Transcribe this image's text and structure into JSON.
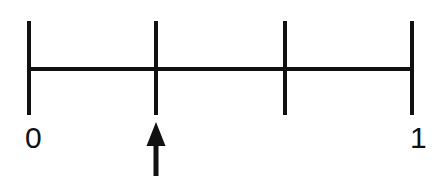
{
  "figure": {
    "kind": "number-line-diagram",
    "background_color": "#ffffff",
    "ink_color": "#111111",
    "width": 437,
    "height": 176
  },
  "chart_data": {
    "type": "line",
    "title": "",
    "subtitle": "",
    "xlabel": "",
    "ylabel": "",
    "orientation": "horizontal",
    "grid": false,
    "legend": null,
    "xlim": [
      0,
      1
    ],
    "axis": {
      "start_value": 0,
      "end_value": 1,
      "start_label": "0",
      "end_label": "1",
      "line_y_px": 69,
      "line_x_start_px": 29,
      "line_x_end_px": 412,
      "line_thickness_px": 4
    },
    "divisions": 3,
    "tick_values": [
      0,
      0.3333,
      0.6667,
      1
    ],
    "tick_fractions": [
      "0",
      "1/3",
      "2/3",
      "1"
    ],
    "tick_labels": [
      "0",
      "",
      "",
      "1"
    ],
    "tick_positions_px": [
      29,
      156,
      285,
      412
    ],
    "tick_top_px": 21,
    "tick_bottom_px": 115,
    "tick_thickness_px": 4,
    "labels": [
      {
        "text": "0",
        "value": 0,
        "x_px": 25,
        "y_px": 123
      },
      {
        "text": "1",
        "value": 1,
        "x_px": 410,
        "y_px": 123
      }
    ],
    "annotations": [
      {
        "kind": "arrow",
        "label": "",
        "points_to_value": 0.3333,
        "points_to_fraction": "1/3",
        "direction": "up",
        "x_px": 156,
        "head_tip_y_px": 122,
        "head_base_y_px": 146,
        "head_width_px": 19,
        "shaft_width_px": 5,
        "shaft_bottom_y_px": 176,
        "color": "#111111"
      }
    ]
  }
}
